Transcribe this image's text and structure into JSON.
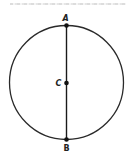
{
  "figure": {
    "type": "circle-with-diameter",
    "colors": {
      "stroke": "#2a2a2a",
      "background": "#ffffff",
      "header_noise": "#d4d4d4"
    },
    "circle": {
      "cx": 66.5,
      "cy": 82.5,
      "r": 57
    },
    "diameter": {
      "from": "A",
      "to": "B"
    },
    "points": [
      {
        "label": "A",
        "role": "top endpoint",
        "x": 66.5,
        "y": 25.5,
        "label_x": 62.5,
        "label_y": 21
      },
      {
        "label": "C",
        "role": "center",
        "x": 66.5,
        "y": 83,
        "label_x": 55.5,
        "label_y": 86
      },
      {
        "label": "B",
        "role": "bottom endpoint",
        "x": 66.5,
        "y": 139.5,
        "label_x": 63.5,
        "label_y": 151
      }
    ]
  }
}
